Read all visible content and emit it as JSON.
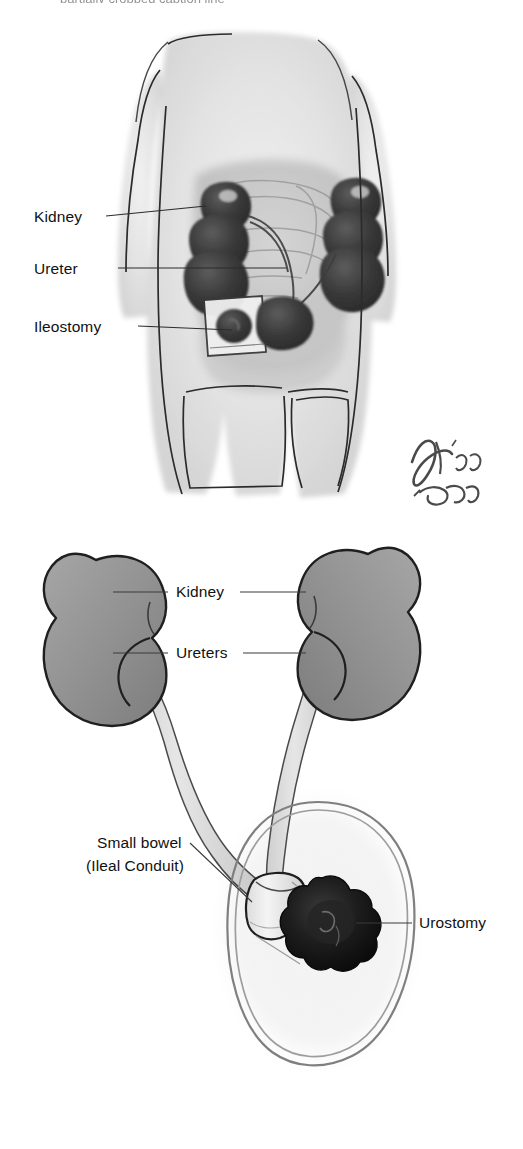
{
  "document": {
    "type": "medical-illustration",
    "subject": "Urostomy (Ileal Conduit) urinary diversion",
    "background_color": "#ffffff",
    "cropped_top_text": "partially cropped caption line"
  },
  "figure_top": {
    "name": "watercolor-torso-ileostomy",
    "style": "grayscale watercolor sketch of a human torso, anterior view",
    "signature": "Eoin '22",
    "labels": [
      {
        "id": "kidney",
        "text": "Kidney"
      },
      {
        "id": "ureter",
        "text": "Ureter"
      },
      {
        "id": "ileostomy",
        "text": "Ileostomy"
      }
    ],
    "colors": {
      "skin_wash": "#e3e3e3",
      "organ_wash": "#c9c9c9",
      "kidney_dark": "#3c3c3c",
      "outline": "#2b2b2b"
    }
  },
  "figure_bottom": {
    "name": "ileal-conduit-schematic",
    "style": "clean vector schematic of kidneys, ureters, ileal conduit and stoma",
    "labels": [
      {
        "id": "kidney",
        "text": "Kidney"
      },
      {
        "id": "ureters",
        "text": "Ureters"
      },
      {
        "id": "small-bowel-line1",
        "text": "Small bowel"
      },
      {
        "id": "small-bowel-line2",
        "text": "(Ileal Conduit)"
      },
      {
        "id": "urostomy",
        "text": "Urostomy"
      }
    ],
    "colors": {
      "kidney_fill": "#8e8e8e",
      "kidney_fill_light": "#a9a9a9",
      "kidney_outline": "#1f1f1f",
      "ureter_fill": "#d8d8d8",
      "ureter_outline": "#4a4a4a",
      "conduit_fill": "#eeeeee",
      "stoma_dark": "#141414",
      "pouch_outline": "#8a8a8a",
      "leader_line": "#3a3a3a"
    }
  }
}
